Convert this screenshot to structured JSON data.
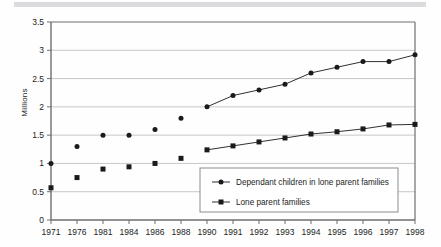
{
  "figure": {
    "background_color": "#fefefe",
    "plot_border_color": "#6e6e6e",
    "gridline_color": "#b9b9b9",
    "series_color": "#1a1a1a",
    "legend_border_color": "#8c8c8c",
    "scan_band_color": "#cfcfd2"
  },
  "chart_data": {
    "type": "line",
    "title": "",
    "subtitle": "",
    "xlabel": "",
    "ylabel": "Millions",
    "ylim": [
      0,
      3.5
    ],
    "yticks": [
      "0",
      "0.5",
      "1",
      "1.5",
      "2",
      "2.5",
      "3",
      "3.5"
    ],
    "ytick_values": [
      0,
      0.5,
      1,
      1.5,
      2,
      2.5,
      3,
      3.5
    ],
    "grid": true,
    "grid_axis": "y",
    "legend_position": "inside-lower-right",
    "categories": [
      "1971",
      "1976",
      "1981",
      "1984",
      "1986",
      "1988",
      "1990",
      "1991",
      "1992",
      "1993",
      "1994",
      "1995",
      "1996",
      "1997",
      "1998"
    ],
    "series": [
      {
        "name": "Dependant children in lone parent families",
        "marker": "circle",
        "values": [
          1.0,
          1.3,
          1.5,
          1.5,
          1.6,
          1.8,
          2.0,
          2.2,
          2.3,
          2.4,
          2.6,
          2.7,
          2.8,
          2.8,
          2.92
        ],
        "connected_from_index": 6
      },
      {
        "name": "Lone parent families",
        "marker": "square",
        "values": [
          0.57,
          0.75,
          0.9,
          0.94,
          1.0,
          1.09,
          1.24,
          1.31,
          1.38,
          1.45,
          1.52,
          1.56,
          1.61,
          1.68,
          1.69
        ],
        "connected_from_index": 6
      }
    ]
  },
  "legend": {
    "entries": [
      {
        "label": "Dependant children in lone parent families",
        "marker": "circle"
      },
      {
        "label": "Lone parent families",
        "marker": "square"
      }
    ]
  }
}
